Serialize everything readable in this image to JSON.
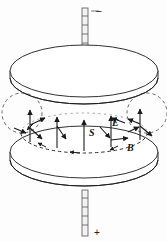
{
  "figure": {
    "background_color": "#fdfdfd",
    "stroke_color": "#1a1a1a",
    "plate_fill": "#ffffff",
    "labels": {
      "poynting": "S",
      "electric": "E",
      "magnetic": "B"
    },
    "terminals": {
      "top_sign": "–",
      "bottom_sign": "+"
    },
    "plates": [
      {
        "name": "top-plate",
        "cx": 84,
        "cy": 71,
        "rx": 74,
        "ry": 26,
        "thickness": 7
      },
      {
        "name": "bottom-plate",
        "cx": 84,
        "cy": 152,
        "rx": 74,
        "ry": 26,
        "thickness": 8
      }
    ],
    "field_circle": {
      "name": "magnetic-field-loop",
      "cx": 84,
      "cy": 133,
      "rx": 63,
      "ry": 20,
      "style": "dashed"
    },
    "edge_circles": [
      {
        "name": "left-edge-circle",
        "cx": 22,
        "cy": 113,
        "r": 20,
        "style": "dashed"
      },
      {
        "name": "right-edge-circle",
        "cx": 147,
        "cy": 113,
        "r": 20,
        "style": "dashed"
      }
    ],
    "vectors": {
      "electric_count": 5,
      "poynting_count": 5,
      "magnetic_count": 4,
      "electric_direction": "up",
      "poynting_direction": "inward-down",
      "magnetic_direction": "counterclockwise"
    },
    "rods": [
      {
        "name": "top-rod",
        "x": 82,
        "y_top": 8,
        "y_bottom": 60,
        "width": 6,
        "rungs": 6
      },
      {
        "name": "bottom-rod",
        "x": 82,
        "y_top": 190,
        "y_bottom": 236,
        "width": 6,
        "rungs": 5
      }
    ]
  }
}
